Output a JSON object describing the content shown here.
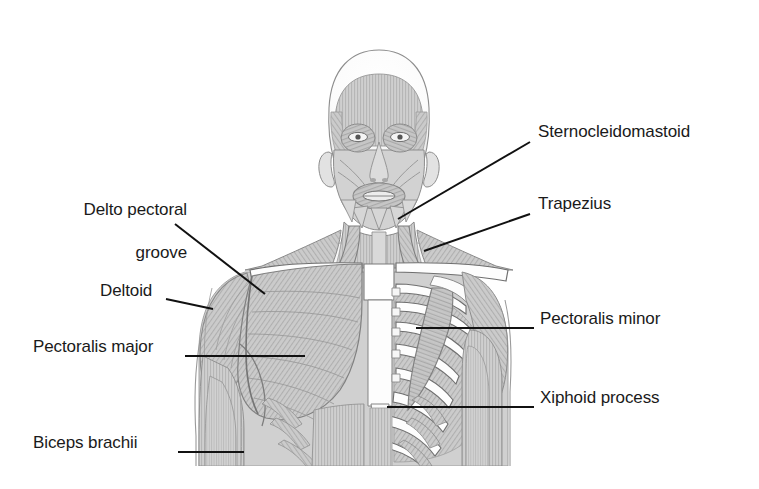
{
  "figure": {
    "view": "anterior",
    "background_color": "#ffffff",
    "line_color": "#111111",
    "muscle_fill": "#c9c9c9",
    "bone_fill": "#fefefe",
    "shade_dark": "#9a9a9a",
    "text_color": "#1a1a1a"
  },
  "labels": [
    {
      "id": "sternocleidomastoid",
      "text": "Sternocleidomastoid",
      "side": "right",
      "text_x": 538,
      "text_y": 130,
      "leader": {
        "x1": 530,
        "y1": 142,
        "x2": 398,
        "y2": 219
      }
    },
    {
      "id": "trapezius",
      "text": "Trapezius",
      "side": "right",
      "text_x": 538,
      "text_y": 202,
      "leader": {
        "x1": 530,
        "y1": 214,
        "x2": 424,
        "y2": 251
      }
    },
    {
      "id": "pectoralis-minor",
      "text": "Pectoralis minor",
      "side": "right",
      "text_x": 540,
      "text_y": 317,
      "leader": {
        "x1": 534,
        "y1": 328,
        "x2": 416,
        "y2": 328
      }
    },
    {
      "id": "xiphoid-process",
      "text": "Xiphoid process",
      "side": "right",
      "text_x": 540,
      "text_y": 396,
      "leader": {
        "x1": 534,
        "y1": 407,
        "x2": 387,
        "y2": 407
      }
    },
    {
      "id": "delto-pectoral-groove",
      "text": "Delto pectoral",
      "text_line2": "groove",
      "side": "left",
      "text_x": 52,
      "text_y": 186,
      "leader": {
        "x1": 175,
        "y1": 224,
        "x2": 265,
        "y2": 294
      }
    },
    {
      "id": "deltoid",
      "text": "Deltoid",
      "side": "left",
      "text_x": 100,
      "text_y": 289,
      "leader": {
        "x1": 166,
        "y1": 299,
        "x2": 213,
        "y2": 309
      }
    },
    {
      "id": "pectoralis-major",
      "text": "Pectoralis major",
      "side": "left",
      "text_x": 33,
      "text_y": 345,
      "leader": {
        "x1": 185,
        "y1": 356,
        "x2": 305,
        "y2": 356
      }
    },
    {
      "id": "biceps-brachii",
      "text": "Biceps brachii",
      "side": "left",
      "text_x": 33,
      "text_y": 441,
      "leader": {
        "x1": 178,
        "y1": 452,
        "x2": 244,
        "y2": 452
      }
    }
  ],
  "anatomy_parts": [
    "cranium",
    "frontalis",
    "orbicularis-oculi",
    "orbicularis-oris",
    "masseter",
    "sternocleidomastoid",
    "trapezius",
    "clavicle",
    "sternum",
    "ribs",
    "pectoralis-major",
    "pectoralis-minor",
    "intercostals",
    "deltoid",
    "biceps-brachii",
    "serratus-anterior",
    "rectus-abdominis",
    "xiphoid-process"
  ]
}
